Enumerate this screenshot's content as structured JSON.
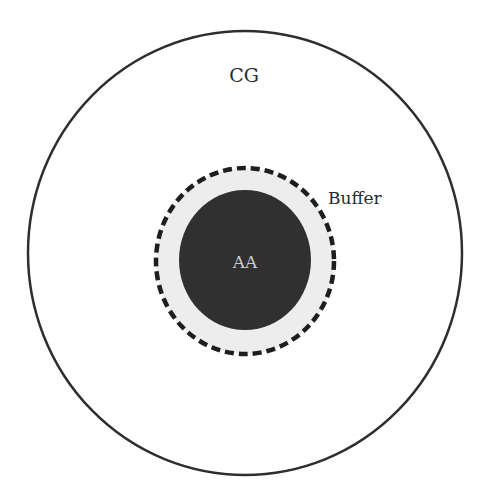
{
  "diagram": {
    "regions": [
      {
        "id": "cg",
        "label": "CG",
        "style": "outer circle, solid outline, white fill"
      },
      {
        "id": "buffer",
        "label": "Buffer",
        "style": "dashed outline, light gray fill"
      },
      {
        "id": "aa",
        "label": "AA",
        "style": "dark filled circle"
      }
    ],
    "labels": {
      "cg": "CG",
      "buffer": "Buffer",
      "aa": "AA"
    },
    "colors": {
      "background": "#ffffff",
      "outline": "#2e2e2e",
      "buffer_fill": "#ededed",
      "aa_fill": "#303030",
      "aa_text": "#cfcfcf",
      "text": "#2a2a2a"
    }
  }
}
